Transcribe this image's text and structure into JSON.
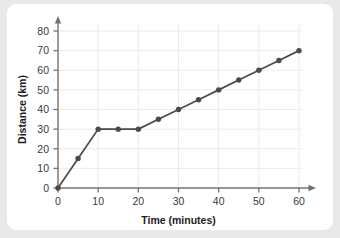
{
  "chart_data": {
    "type": "line",
    "title": "",
    "xlabel": "Time (minutes)",
    "ylabel": "Distance (km)",
    "xlim": [
      0,
      60
    ],
    "ylim": [
      0,
      80
    ],
    "xticks": [
      0,
      10,
      20,
      30,
      40,
      50,
      60
    ],
    "yticks": [
      0,
      10,
      20,
      30,
      40,
      50,
      60,
      70,
      80
    ],
    "grid": true,
    "legend": "none",
    "x": [
      0,
      5,
      10,
      15,
      20,
      25,
      30,
      35,
      40,
      45,
      50,
      55,
      60
    ],
    "series": [
      {
        "name": "Distance",
        "values": [
          0,
          15,
          30,
          30,
          30,
          35,
          40,
          45,
          50,
          55,
          60,
          65,
          70
        ],
        "color": "#4a4a4a",
        "marker": "circle"
      }
    ],
    "annotations": []
  },
  "style": {
    "line_color": "#4a4a4a",
    "grid_color": "#eceaea",
    "axis_color": "#737373",
    "card_background": "#ffffff",
    "page_background": "#e9e9e9",
    "tick_label_color": "#3a3a3a",
    "axis_title_color": "#1d1d1d"
  }
}
